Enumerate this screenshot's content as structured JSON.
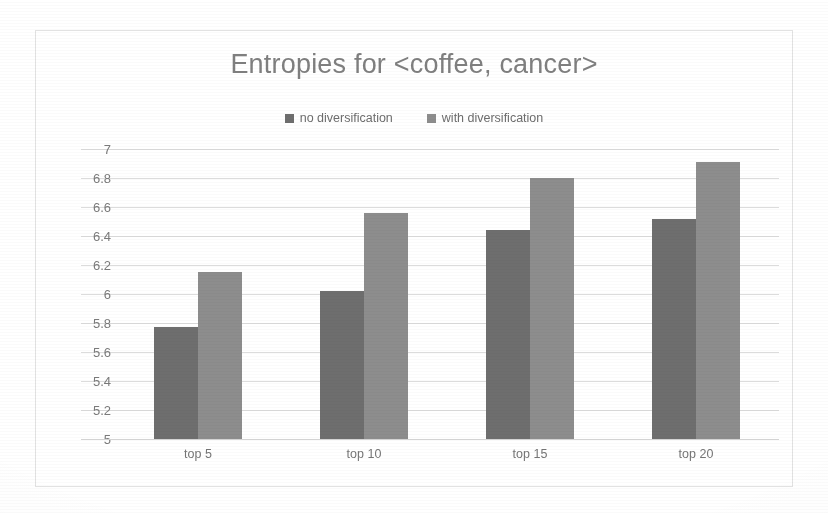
{
  "chart_data": {
    "type": "bar",
    "title": "Entropies for <coffee, cancer>",
    "xlabel": "",
    "ylabel": "",
    "categories": [
      "top 5",
      "top 10",
      "top 15",
      "top 20"
    ],
    "series": [
      {
        "name": "no diversification",
        "color": "#6e6e6e",
        "values": [
          5.77,
          6.02,
          6.44,
          6.52
        ]
      },
      {
        "name": "with diversification",
        "color": "#8d8d8d",
        "values": [
          6.15,
          6.56,
          6.8,
          6.91
        ]
      }
    ],
    "ylim": [
      5,
      7
    ],
    "ytick_step": 0.2,
    "yticks": [
      "7",
      "6.8",
      "6.6",
      "6.4",
      "6.2",
      "6",
      "5.8",
      "5.6",
      "5.4",
      "5.2",
      "5"
    ],
    "grid": true,
    "legend_position": "top-center",
    "legend_marker": "square-swatch",
    "colors": {
      "title_text": "#7f7f7f",
      "tick_text": "#7a7a7a",
      "gridline": "#dcdcdc",
      "frame_border": "#e2e2e2",
      "background": "#ffffff"
    }
  }
}
